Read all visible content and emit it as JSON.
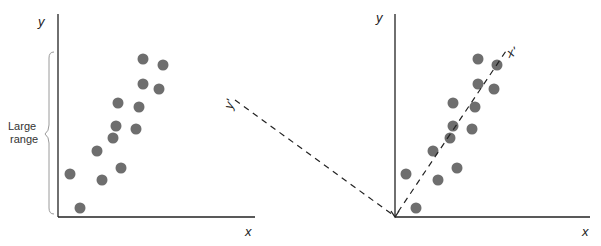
{
  "left_panel": {
    "y_label": "y",
    "x_label": "x",
    "brace_label_line1": "Large",
    "brace_label_line2": "range",
    "points": [
      [
        70,
        174
      ],
      [
        80,
        208
      ],
      [
        97,
        151
      ],
      [
        102,
        180
      ],
      [
        113,
        138
      ],
      [
        116,
        126
      ],
      [
        118,
        103
      ],
      [
        121,
        168
      ],
      [
        136,
        129
      ],
      [
        139,
        107
      ],
      [
        143,
        59
      ],
      [
        143,
        84
      ],
      [
        159,
        89
      ],
      [
        163,
        65
      ]
    ]
  },
  "right_panel": {
    "y_label": "y",
    "x_label": "x",
    "rotated_x_label": "x'",
    "rotated_y_label": "y'",
    "points": [
      [
        406,
        174
      ],
      [
        416,
        208
      ],
      [
        433,
        151
      ],
      [
        438,
        180
      ],
      [
        450,
        138
      ],
      [
        453,
        126
      ],
      [
        453,
        103
      ],
      [
        457,
        168
      ],
      [
        472,
        129
      ],
      [
        475,
        107
      ],
      [
        478,
        59
      ],
      [
        478,
        84
      ],
      [
        494,
        89
      ],
      [
        497,
        65
      ]
    ]
  },
  "colors": {
    "dot": "#6e6e6e",
    "axis": "#222222",
    "brace": "#9a9a9a"
  }
}
